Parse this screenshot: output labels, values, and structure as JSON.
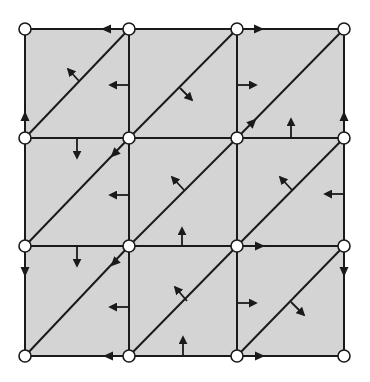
{
  "diagram": {
    "type": "triangulated-grid-mesh",
    "colors": {
      "fill": "#d4d4d4",
      "stroke": "#1a1a1a",
      "node_fill": "#ffffff",
      "background": "#ffffff"
    },
    "grid": {
      "cols": 3,
      "rows": 3,
      "x": [
        25,
        129,
        237,
        344
      ],
      "y": [
        29,
        138,
        246,
        356
      ]
    },
    "node_radius": 6,
    "edge_arrowheads": [
      {
        "id": "top-c0",
        "x": 106,
        "y": 29,
        "dir": "left"
      },
      {
        "id": "top-c2",
        "x": 259,
        "y": 29,
        "dir": "right"
      },
      {
        "id": "left-r0",
        "x": 25,
        "y": 116,
        "dir": "up"
      },
      {
        "id": "left-r2",
        "x": 25,
        "y": 272,
        "dir": "down"
      },
      {
        "id": "right-r0",
        "x": 344,
        "y": 116,
        "dir": "up"
      },
      {
        "id": "right-r2",
        "x": 344,
        "y": 272,
        "dir": "down"
      },
      {
        "id": "bottom-c0",
        "x": 108,
        "y": 356,
        "dir": "left"
      },
      {
        "id": "bottom-c2",
        "x": 260,
        "y": 356,
        "dir": "right"
      },
      {
        "id": "h246-c2",
        "x": 260,
        "y": 246,
        "dir": "right"
      },
      {
        "id": "diag-r0c2",
        "x": 253,
        "y": 122,
        "dir": "up-right"
      },
      {
        "id": "diag-r1c0",
        "x": 114,
        "y": 154,
        "dir": "down-left"
      },
      {
        "id": "diag-r2c0",
        "x": 114,
        "y": 263,
        "dir": "down-left"
      }
    ],
    "normal_arrows": [
      {
        "id": "diag-r0c0",
        "x1": 79,
        "y1": 81,
        "x2": 68,
        "y2": 69
      },
      {
        "id": "vert-x129-r0",
        "x1": 129,
        "y1": 85,
        "x2": 110,
        "y2": 85
      },
      {
        "id": "diag-r0c1",
        "x1": 180,
        "y1": 88,
        "x2": 192,
        "y2": 100
      },
      {
        "id": "vert-x237-r0",
        "x1": 237,
        "y1": 85,
        "x2": 256,
        "y2": 85
      },
      {
        "id": "horiz-y138-c2",
        "x1": 291,
        "y1": 138,
        "x2": 291,
        "y2": 119
      },
      {
        "id": "horiz-y138-c0",
        "x1": 77,
        "y1": 138,
        "x2": 77,
        "y2": 158
      },
      {
        "id": "vert-x129-r1",
        "x1": 129,
        "y1": 195,
        "x2": 110,
        "y2": 195
      },
      {
        "id": "diag-r1c1",
        "x1": 184,
        "y1": 190,
        "x2": 172,
        "y2": 177
      },
      {
        "id": "vert-x344-r1",
        "x1": 344,
        "y1": 194,
        "x2": 325,
        "y2": 194
      },
      {
        "id": "diag-r1c2",
        "x1": 292,
        "y1": 190,
        "x2": 280,
        "y2": 177
      },
      {
        "id": "horiz-y246-c1",
        "x1": 182,
        "y1": 246,
        "x2": 182,
        "y2": 228
      },
      {
        "id": "horiz-y246-c0",
        "x1": 77,
        "y1": 246,
        "x2": 77,
        "y2": 266
      },
      {
        "id": "vert-x129-r2",
        "x1": 129,
        "y1": 307,
        "x2": 110,
        "y2": 307
      },
      {
        "id": "diag-r2c1",
        "x1": 187,
        "y1": 301,
        "x2": 175,
        "y2": 287
      },
      {
        "id": "horiz-y356-c1",
        "x1": 183,
        "y1": 356,
        "x2": 183,
        "y2": 337
      },
      {
        "id": "vert-x237-r2",
        "x1": 237,
        "y1": 303,
        "x2": 256,
        "y2": 303
      },
      {
        "id": "diag-r2c2",
        "x1": 291,
        "y1": 302,
        "x2": 304,
        "y2": 315
      }
    ]
  }
}
